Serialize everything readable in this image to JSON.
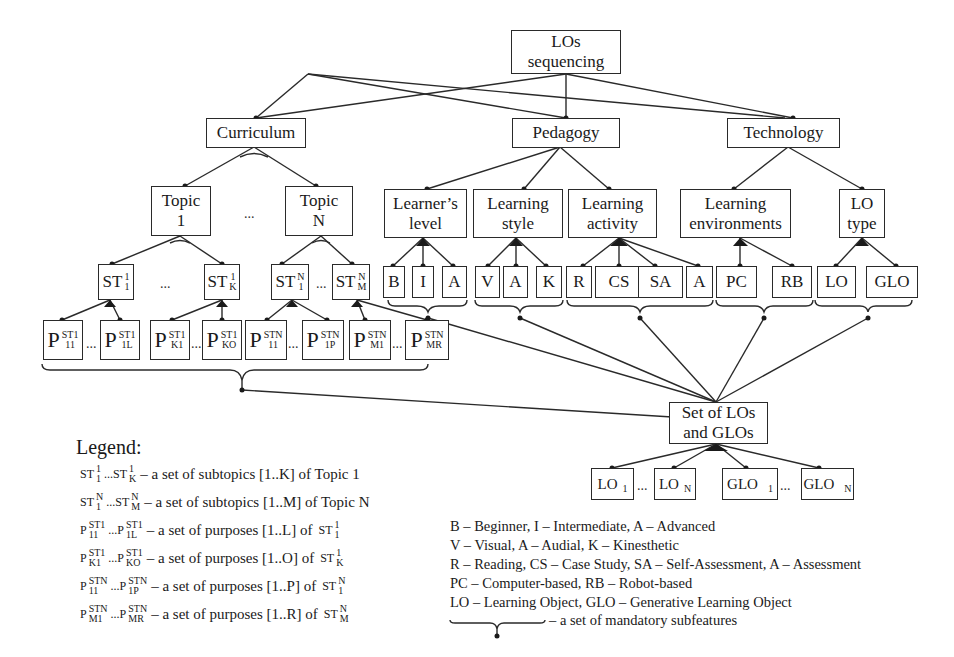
{
  "root": {
    "line1": "LOs",
    "line2": "sequencing"
  },
  "level1": {
    "curriculum": "Curriculum",
    "pedagogy": "Pedagogy",
    "technology": "Technology"
  },
  "level2": {
    "topic1": {
      "line1": "Topic",
      "line2": "1"
    },
    "topicN": {
      "line1": "Topic",
      "line2": "N"
    },
    "learners_level": {
      "line1": "Learner’s",
      "line2": "level"
    },
    "learning_style": {
      "line1": "Learning",
      "line2": "style"
    },
    "learning_activity": {
      "line1": "Learning",
      "line2": "activity"
    },
    "learning_environments": {
      "line1": "Learning",
      "line2": "environments"
    },
    "lo_type": {
      "line1": "LO",
      "line2": "type"
    }
  },
  "subtopics": [
    {
      "base": "ST",
      "sup": "1",
      "sub": "1"
    },
    {
      "base": "ST",
      "sup": "1",
      "sub": "K"
    },
    {
      "base": "ST",
      "sup": "N",
      "sub": "1"
    },
    {
      "base": "ST",
      "sup": "N",
      "sub": "M"
    }
  ],
  "leaves": {
    "learners_level": [
      "B",
      "I",
      "A"
    ],
    "learning_style": [
      "V",
      "A",
      "K"
    ],
    "learning_activity": [
      "R",
      "CS",
      "SA",
      "A"
    ],
    "learning_environments": [
      "PC",
      "RB"
    ],
    "lo_type": [
      "LO",
      "GLO"
    ]
  },
  "purposes": [
    {
      "base": "P",
      "sup": "ST1",
      "sub": "11"
    },
    {
      "base": "P",
      "sup": "ST1",
      "sub": "1L"
    },
    {
      "base": "P",
      "sup": "ST1",
      "sub": "K1"
    },
    {
      "base": "P",
      "sup": "ST1",
      "sub": "KO"
    },
    {
      "base": "P",
      "sup": "STN",
      "sub": "11"
    },
    {
      "base": "P",
      "sup": "STN",
      "sub": "1P"
    },
    {
      "base": "P",
      "sup": "STN",
      "sub": "M1"
    },
    {
      "base": "P",
      "sup": "STN",
      "sub": "MR"
    }
  ],
  "set_node": {
    "line1": "Set of LOs",
    "line2": "and GLOs"
  },
  "objects": [
    {
      "base": "LO",
      "sub": "1"
    },
    {
      "base": "LO",
      "sub": "N"
    },
    {
      "base": "GLO",
      "sub": "1"
    },
    {
      "base": "GLO",
      "sub": "N"
    }
  ],
  "ellipsis": "...",
  "legend": {
    "title": "Legend:",
    "rows": [
      {
        "a": "ST",
        "a_sup": "1",
        "a_sub": "1",
        "b": "ST",
        "b_sup": "1",
        "b_sub": "K",
        "desc": "– a set of subtopics [1..K] of Topic 1",
        "of": ""
      },
      {
        "a": "ST",
        "a_sup": "N",
        "a_sub": "1",
        "b": "ST",
        "b_sup": "N",
        "b_sub": "M",
        "desc": "– a set of subtopics [1..M] of Topic N",
        "of": ""
      },
      {
        "a": "P",
        "a_sup": "ST1",
        "a_sub": "11",
        "b": "P",
        "b_sup": "ST1",
        "b_sub": "1L",
        "desc": "– a set of purposes [1..L] of",
        "of": "ST",
        "of_sup": "1",
        "of_sub": "1"
      },
      {
        "a": "P",
        "a_sup": "ST1",
        "a_sub": "K1",
        "b": "P",
        "b_sup": "ST1",
        "b_sub": "KO",
        "desc": "– a set of purposes [1..O] of",
        "of": "ST",
        "of_sup": "1",
        "of_sub": "K"
      },
      {
        "a": "P",
        "a_sup": "STN",
        "a_sub": "11",
        "b": "P",
        "b_sup": "STN",
        "b_sub": "1P",
        "desc": "– a set of purposes [1..P] of",
        "of": "ST",
        "of_sup": "N",
        "of_sub": "1"
      },
      {
        "a": "P",
        "a_sup": "STN",
        "a_sub": "M1",
        "b": "P",
        "b_sup": "STN",
        "b_sub": "MR",
        "desc": "– a set of purposes [1..R] of",
        "of": "ST",
        "of_sup": "N",
        "of_sub": "M"
      }
    ]
  },
  "abbreviations": [
    "B – Beginner, I – Intermediate, A – Advanced",
    "V – Visual, A – Audial, K – Kinesthetic",
    "R – Reading, CS – Case Study, SA – Self-Assessment, A – Assessment",
    "PC – Computer-based, RB – Robot-based",
    "LO – Learning Object, GLO – Generative Learning Object"
  ],
  "mandatory_legend": "– a set of mandatory subfeatures"
}
